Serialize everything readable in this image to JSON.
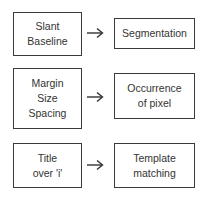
{
  "diagram": {
    "rows": [
      {
        "input": {
          "lines": [
            "Slant",
            "Baseline"
          ]
        },
        "arrow": "right-arrow",
        "output": {
          "lines": [
            "Segmentation"
          ]
        }
      },
      {
        "input": {
          "lines": [
            "Margin",
            "Size",
            "Spacing"
          ]
        },
        "arrow": "right-arrow",
        "output": {
          "lines": [
            "Occurrence",
            "of pixel"
          ]
        }
      },
      {
        "input": {
          "lines": [
            "Title",
            "over 'i'"
          ]
        },
        "arrow": "right-arrow",
        "output": {
          "lines": [
            "Template",
            "matching"
          ]
        }
      }
    ],
    "colors": {
      "border": "#3a3a3a",
      "text": "#333333",
      "background": "#ffffff"
    }
  }
}
